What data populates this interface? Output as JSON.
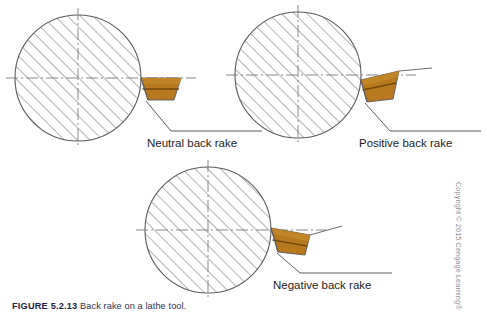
{
  "figure": {
    "caption_number": "FIGURE 5.2.13",
    "caption_body": "Back rake on a lathe tool.",
    "copyright": "Copyright © 2015 Cengage Learning®"
  },
  "diagrams": [
    {
      "id": "neutral",
      "label": "Neutral back rake",
      "rake_type": "neutral",
      "description": "Tool top face parallel to the centerline axis"
    },
    {
      "id": "positive",
      "label": "Positive back rake",
      "rake_type": "positive",
      "description": "Tool top face slopes down toward the cutting edge"
    },
    {
      "id": "negative",
      "label": "Negative back rake",
      "rake_type": "negative",
      "description": "Tool top face slopes up toward the cutting edge"
    }
  ],
  "colors": {
    "tool_body": "#b8791e",
    "tool_shade": "#9a6216",
    "tool_band": "#74490f",
    "outline": "#5a5a5f",
    "hatch": "#6d6d72",
    "centerline": "#7a7a80",
    "leader": "#4a4a50",
    "label_text": "#1c1c22",
    "caption_text": "#2a2f4a",
    "copyright_text": "#8d8d93"
  }
}
